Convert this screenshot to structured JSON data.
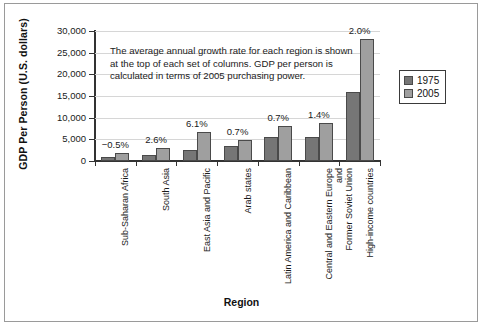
{
  "chart_data": {
    "type": "bar",
    "title": "",
    "xlabel": "Region",
    "ylabel": "GDP Per Person (U.S. dollars)",
    "ylim": [
      0,
      30000
    ],
    "ytick_labels": [
      "0",
      "5,000",
      "10,000",
      "15,000",
      "20,000",
      "25,000",
      "30,000"
    ],
    "ytick_values": [
      0,
      5000,
      10000,
      15000,
      20000,
      25000,
      30000
    ],
    "grid": true,
    "legend_position": "right",
    "categories": [
      "Sub-Saharan Africa",
      "South Asia",
      "East Asia and Pacific",
      "Arab states",
      "Latin America and Caribbean",
      "Central and Eastern Europe and\nFormer Soviet Union",
      "High-income countries"
    ],
    "series": [
      {
        "name": "1975",
        "color": "#767676",
        "values": [
          900,
          1500,
          2600,
          3400,
          5600,
          5600,
          16000
        ]
      },
      {
        "name": "2005",
        "color": "#9f9f9f",
        "values": [
          1900,
          3100,
          6700,
          4800,
          8100,
          8800,
          28200
        ]
      }
    ],
    "annotations": {
      "growth_labels": [
        "−0.5%",
        "2.6%",
        "6.1%",
        "0.7%",
        "0.7%",
        "1.4%",
        "2.0%"
      ],
      "note": "The average annual growth rate for each region is shown at the top of each set of columns. GDP per person is calculated in terms of 2005 purchasing power."
    }
  },
  "legend": {
    "items": [
      {
        "label": "1975"
      },
      {
        "label": "2005"
      }
    ]
  }
}
